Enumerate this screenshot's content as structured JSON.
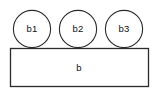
{
  "diagram": {
    "background_color": "#ffffff",
    "stroke_color": "#2b2b2b",
    "fill_color": "#ffffff",
    "text_color": "#111111",
    "base": {
      "label": "b",
      "shape": "rectangle",
      "x": 10,
      "y": 48,
      "width": 139,
      "height": 39,
      "label_x": 79,
      "label_y": 68
    },
    "parts": [
      {
        "label": "b1",
        "shape": "circle",
        "cx": 32,
        "cy": 29,
        "r": 19
      },
      {
        "label": "b2",
        "shape": "circle",
        "cx": 78,
        "cy": 29,
        "r": 19
      },
      {
        "label": "b3",
        "shape": "circle",
        "cx": 124,
        "cy": 29,
        "r": 19
      }
    ]
  }
}
